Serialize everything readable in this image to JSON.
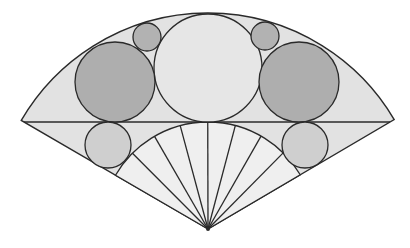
{
  "diagram": {
    "type": "geometric-sector-with-inscribed-circles",
    "colors": {
      "background": "#ffffff",
      "sector_fill": "#e2e2e2",
      "inner_fan_fill": "#efefef",
      "large_circle_fill": "#aeaeae",
      "center_circle_fill": "#e6e6e6",
      "small_circle_fill": "#b2b2b2",
      "lower_circle_fill": "#cfcfcf",
      "stroke": "#2a2a2a"
    },
    "apex": [
      208,
      229
    ],
    "outer_radius": 216,
    "inner_radius": 107,
    "chord_y": 122,
    "chord_left": [
      24,
      122
    ],
    "chord_right": [
      390,
      122
    ],
    "circles": [
      {
        "name": "center-large-circle",
        "cx": 208,
        "cy": 68,
        "r": 54,
        "fill": "center"
      },
      {
        "name": "left-large-circle",
        "cx": 115,
        "cy": 82,
        "r": 40,
        "fill": "large"
      },
      {
        "name": "right-large-circle",
        "cx": 299,
        "cy": 82,
        "r": 40,
        "fill": "large"
      },
      {
        "name": "left-small-circle",
        "cx": 147,
        "cy": 37,
        "r": 14,
        "fill": "small"
      },
      {
        "name": "right-small-circle",
        "cx": 265,
        "cy": 36,
        "r": 14,
        "fill": "small"
      },
      {
        "name": "left-lower-circle",
        "cx": 108,
        "cy": 145,
        "r": 23,
        "fill": "lower"
      },
      {
        "name": "right-lower-circle",
        "cx": 305,
        "cy": 145,
        "r": 23,
        "fill": "lower"
      }
    ],
    "fan_ray_count": 8
  }
}
